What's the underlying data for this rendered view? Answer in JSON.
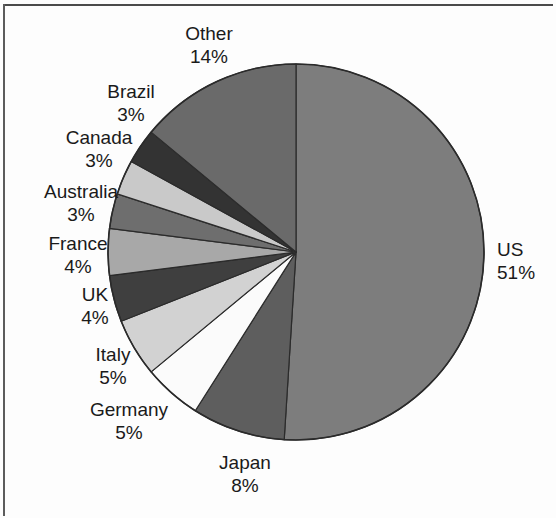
{
  "chart_data": {
    "type": "pie",
    "title": "",
    "subtitle": "",
    "xlabel": "",
    "ylabel": "",
    "legend_position": "none",
    "grid": false,
    "units": "percent",
    "start_angle_deg": 0,
    "direction": "clockwise",
    "categories": [
      "US",
      "Japan",
      "Germany",
      "Italy",
      "UK",
      "France",
      "Australia",
      "Canada",
      "Brazil",
      "Other"
    ],
    "values": [
      51,
      8,
      5,
      5,
      4,
      4,
      3,
      3,
      3,
      14
    ],
    "slices": [
      {
        "label": "US",
        "percent": 51,
        "percent_text": "51%",
        "color": "#7d7d7d"
      },
      {
        "label": "Japan",
        "percent": 8,
        "percent_text": "8%",
        "color": "#5e5e5e"
      },
      {
        "label": "Germany",
        "percent": 5,
        "percent_text": "5%",
        "color": "#fbfbfb"
      },
      {
        "label": "Italy",
        "percent": 5,
        "percent_text": "5%",
        "color": "#d2d2d2"
      },
      {
        "label": "UK",
        "percent": 4,
        "percent_text": "4%",
        "color": "#3f3f3f"
      },
      {
        "label": "France",
        "percent": 4,
        "percent_text": "4%",
        "color": "#a8a8a8"
      },
      {
        "label": "Australia",
        "percent": 3,
        "percent_text": "3%",
        "color": "#6e6e6e"
      },
      {
        "label": "Canada",
        "percent": 3,
        "percent_text": "3%",
        "color": "#c9c9c9"
      },
      {
        "label": "Brazil",
        "percent": 3,
        "percent_text": "3%",
        "color": "#333333"
      },
      {
        "label": "Other",
        "percent": 14,
        "percent_text": "14%",
        "color": "#6a6a6a"
      }
    ]
  },
  "labels": {
    "other": {
      "name": "Other",
      "pct": "14%"
    },
    "brazil": {
      "name": "Brazil",
      "pct": "3%"
    },
    "canada": {
      "name": "Canada",
      "pct": "3%"
    },
    "australia": {
      "name": "Australia",
      "pct": "3%"
    },
    "france": {
      "name": "France",
      "pct": "4%"
    },
    "uk": {
      "name": "UK",
      "pct": "4%"
    },
    "italy": {
      "name": "Italy",
      "pct": "5%"
    },
    "germany": {
      "name": "Germany",
      "pct": "5%"
    },
    "japan": {
      "name": "Japan",
      "pct": "8%"
    },
    "us": {
      "name": "US",
      "pct": "51%"
    }
  },
  "style": {
    "background": "#ffffff",
    "outline": "#2b2b2b",
    "text": "#1a1a1a"
  }
}
